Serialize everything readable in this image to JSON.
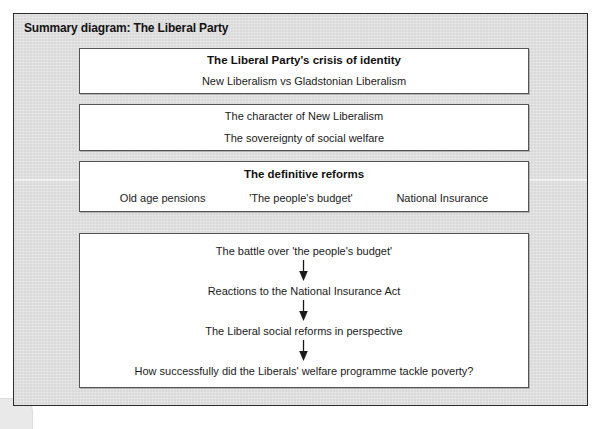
{
  "diagram": {
    "title": "Summary diagram: The Liberal Party",
    "frame_color": "#2b2b2b",
    "panel_background": "#dddddd",
    "box_background": "#ffffff",
    "box_border_color": "#555555",
    "text_color": "#1a1a1a"
  },
  "boxes": [
    {
      "id": "crisis-of-identity",
      "heading": "The Liberal Party's crisis of identity",
      "lines": [
        "New Liberalism vs Gladstonian Liberalism"
      ]
    },
    {
      "id": "new-liberalism",
      "heading": "",
      "lines": [
        "The character of New Liberalism",
        "The sovereignty of social welfare"
      ]
    },
    {
      "id": "definitive-reforms",
      "heading": "The definitive reforms",
      "items": [
        "Old age pensions",
        "'The people's budget'",
        "National Insurance"
      ]
    }
  ],
  "flow": {
    "id": "liberal-reforms-flow",
    "arrow_icon": "arrow-down-icon",
    "steps": [
      "The battle over 'the people's budget'",
      "Reactions to the National Insurance Act",
      "The Liberal social reforms in perspective",
      "How successfully did the Liberals' welfare programme tackle poverty?"
    ]
  }
}
